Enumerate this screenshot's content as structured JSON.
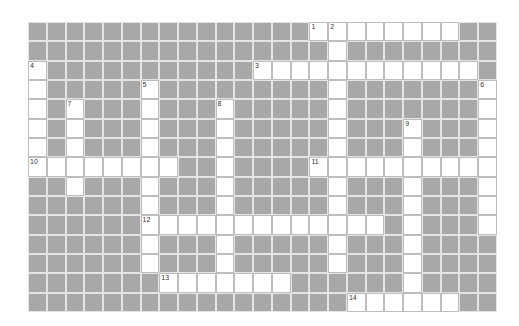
{
  "puzzle": {
    "rows": 15,
    "cols": 25,
    "colors": {
      "block": "#a8a8a8",
      "open": "#ffffff"
    },
    "entries": [
      {
        "number": "1",
        "direction": "across",
        "row": 0,
        "col": 15,
        "length": 8
      },
      {
        "number": "2",
        "direction": "down",
        "row": 0,
        "col": 16,
        "length": 13
      },
      {
        "number": "3",
        "direction": "across",
        "row": 2,
        "col": 12,
        "length": 12
      },
      {
        "number": "4",
        "direction": "down",
        "row": 2,
        "col": 0,
        "length": 6
      },
      {
        "number": "5",
        "direction": "down",
        "row": 3,
        "col": 6,
        "length": 10
      },
      {
        "number": "6",
        "direction": "down",
        "row": 3,
        "col": 24,
        "length": 8
      },
      {
        "number": "7",
        "direction": "down",
        "row": 4,
        "col": 2,
        "length": 5
      },
      {
        "number": "8",
        "direction": "down",
        "row": 4,
        "col": 10,
        "length": 10
      },
      {
        "number": "9",
        "direction": "down",
        "row": 5,
        "col": 20,
        "length": 10
      },
      {
        "number": "10",
        "direction": "across",
        "row": 7,
        "col": 0,
        "length": 8
      },
      {
        "number": "11",
        "direction": "across",
        "row": 7,
        "col": 15,
        "length": 10
      },
      {
        "number": "12",
        "direction": "across",
        "row": 10,
        "col": 6,
        "length": 13
      },
      {
        "number": "13",
        "direction": "across",
        "row": 13,
        "col": 7,
        "length": 7
      },
      {
        "number": "14",
        "direction": "across",
        "row": 14,
        "col": 17,
        "length": 6
      }
    ]
  }
}
